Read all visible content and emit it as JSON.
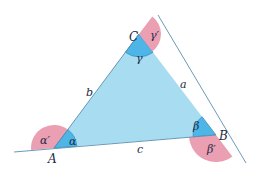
{
  "colors": {
    "triangle_fill": "#a8dcf1",
    "interior_angle_fill": "#4db6e6",
    "exterior_angle_fill": "#ea9fb2",
    "line": "#5a8fb0",
    "text": "#1d2a44"
  },
  "vertices": {
    "A": {
      "label": "A",
      "x": 54,
      "y": 148
    },
    "B": {
      "label": "B",
      "x": 216,
      "y": 135
    },
    "C": {
      "label": "C",
      "x": 139,
      "y": 34
    }
  },
  "sides": {
    "a": {
      "label": "a",
      "between": "B-C"
    },
    "b": {
      "label": "b",
      "between": "A-C"
    },
    "c": {
      "label": "c",
      "between": "A-B"
    }
  },
  "interior_angles": {
    "alpha": {
      "label": "α",
      "vertex": "A"
    },
    "beta": {
      "label": "β",
      "vertex": "B"
    },
    "gamma": {
      "label": "γ",
      "vertex": "C"
    }
  },
  "exterior_angles": {
    "alpha_prime": {
      "label": "α′",
      "vertex": "A"
    },
    "beta_prime": {
      "label": "β′",
      "vertex": "B"
    },
    "gamma_prime": {
      "label": "γ′",
      "vertex": "C"
    }
  }
}
